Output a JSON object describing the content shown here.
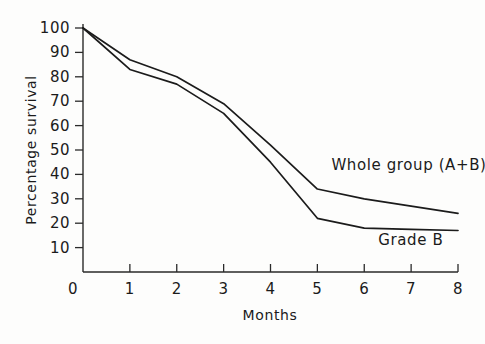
{
  "chart_data": {
    "type": "line",
    "title": "",
    "subtitle": "",
    "xlabel": "Months",
    "ylabel": "Percentage survival",
    "xlim": [
      0,
      8
    ],
    "ylim": [
      0,
      100
    ],
    "grid": false,
    "legend_position": "inline-annotation",
    "x": [
      0,
      1,
      2,
      3,
      4,
      5,
      6,
      7,
      8
    ],
    "xticks": [
      "0",
      "1",
      "2",
      "3",
      "4",
      "5",
      "6",
      "7",
      "8"
    ],
    "yticks": [
      "10",
      "20",
      "30",
      "40",
      "50",
      "60",
      "70",
      "80",
      "90",
      "100"
    ],
    "ytick_values": [
      10,
      20,
      30,
      40,
      50,
      60,
      70,
      80,
      90,
      100
    ],
    "series": [
      {
        "name": "Whole group (A+B)",
        "label": "Whole group (A+B)",
        "values": [
          100,
          87,
          80,
          69,
          52,
          34,
          30,
          27,
          24
        ],
        "color": "#1b1b1b"
      },
      {
        "name": "Grade B",
        "label": "Grade B",
        "values": [
          100,
          83,
          77,
          65,
          45,
          22,
          18,
          17.5,
          17
        ],
        "color": "#1b1b1b"
      }
    ],
    "annotations": [
      {
        "text": "Whole group (A+B)",
        "x": 5.3,
        "y": 42
      },
      {
        "text": "Grade B",
        "x": 6.3,
        "y": 11
      }
    ]
  },
  "axes": {
    "x_axis_name": "months-axis",
    "y_axis_name": "percentage-survival-axis"
  }
}
